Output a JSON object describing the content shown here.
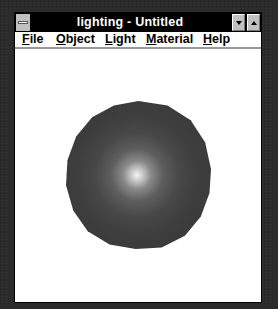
{
  "window": {
    "title": "lighting - Untitled",
    "system_menu_icon": "system-menu-icon",
    "minimize_icon": "triangle-down",
    "maximize_icon": "triangle-up"
  },
  "menubar": {
    "items": [
      {
        "label": "File",
        "mnemonic": "F",
        "rest": "ile"
      },
      {
        "label": "Object",
        "mnemonic": "O",
        "rest": "bject"
      },
      {
        "label": "Light",
        "mnemonic": "L",
        "rest": "ight"
      },
      {
        "label": "Material",
        "mnemonic": "M",
        "rest": "aterial"
      },
      {
        "label": "Help",
        "mnemonic": "H",
        "rest": "elp"
      }
    ]
  },
  "canvas": {
    "object": "shaded sphere",
    "colors": {
      "background": "#ffffff",
      "sphere_base": "#3c3c3c",
      "highlight": "#f4f4f4"
    }
  }
}
